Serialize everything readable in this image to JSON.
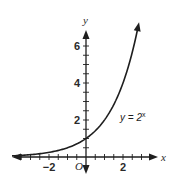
{
  "chart_data": {
    "type": "line",
    "title": "",
    "xlabel": "x",
    "ylabel": "y",
    "origin_label": "O",
    "xlim": [
      -4,
      4
    ],
    "ylim": [
      -1,
      7
    ],
    "grid": false,
    "x_minor_tick_step": 0.5,
    "y_minor_tick_step": 0.5,
    "x_tick_labels": [
      {
        "value": -2,
        "text": "−2"
      },
      {
        "value": 2,
        "text": "2"
      }
    ],
    "y_tick_labels": [
      {
        "value": 2,
        "text": "2"
      },
      {
        "value": 4,
        "text": "4"
      },
      {
        "value": 6,
        "text": "6"
      }
    ],
    "series": [
      {
        "name": "y = 2^x",
        "function": "2^x",
        "x": [
          -4,
          -3.5,
          -3,
          -2.5,
          -2,
          -1.5,
          -1,
          -0.5,
          0,
          0.5,
          1,
          1.5,
          2,
          2.5,
          2.8
        ],
        "y": [
          0.0625,
          0.088,
          0.125,
          0.177,
          0.25,
          0.354,
          0.5,
          0.707,
          1,
          1.414,
          2,
          2.828,
          4,
          5.657,
          6.964
        ],
        "color": "#1e1e1e"
      }
    ],
    "annotations": [
      {
        "text_base": "y = 2",
        "text_exp": "x",
        "anchor_x": 2.3,
        "anchor_y": 2
      }
    ]
  }
}
